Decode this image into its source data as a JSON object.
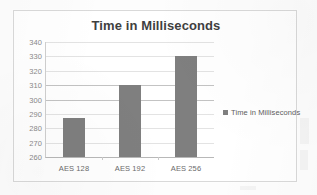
{
  "chart_data": {
    "type": "bar",
    "title": "Time in Milliseconds",
    "xlabel": "",
    "ylabel": "",
    "categories": [
      "AES 128",
      "AES 192",
      "AES 256"
    ],
    "values": [
      287,
      310,
      330
    ],
    "series": [
      {
        "name": "Time in Milliseconds",
        "values": [
          287,
          310,
          330
        ],
        "color": "#7f7f7f"
      }
    ],
    "ylim": [
      260,
      340
    ],
    "ytick_step": 10,
    "yticks": [
      340,
      330,
      320,
      310,
      300,
      290,
      280,
      270,
      260
    ],
    "ytick_labels": [
      "340",
      "330",
      "320",
      "310",
      "300",
      "290",
      "280",
      "270",
      "260"
    ],
    "grid": true,
    "legend": {
      "position": "right",
      "entries": [
        {
          "label": "Time in Milliseconds",
          "color": "#7f7f7f",
          "marker": "square-marker"
        }
      ]
    },
    "colors": {
      "bar": "#7f7f7f",
      "title_text": "#3f3f3f",
      "tick_text": "#8a8a8a",
      "category_text": "#6b6b6b",
      "legend_text": "#5e5e5e",
      "gridline": "#e3e3e3",
      "axis": "#b8b8b8",
      "frame_border": "#d9d9d9",
      "background": "#ffffff"
    }
  }
}
